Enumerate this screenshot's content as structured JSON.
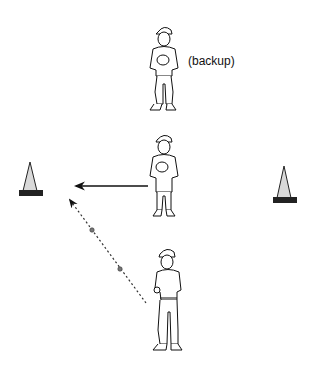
{
  "diagram": {
    "labels": {
      "backup": "(backup)"
    },
    "elements": [
      {
        "id": "cone-left",
        "type": "cone"
      },
      {
        "id": "cone-right",
        "type": "cone"
      },
      {
        "id": "player-backup",
        "type": "player",
        "role": "backup"
      },
      {
        "id": "player-middle",
        "type": "player",
        "role": "fielder"
      },
      {
        "id": "player-coach",
        "type": "player",
        "role": "thrower"
      }
    ],
    "arrows": [
      {
        "from": "player-middle",
        "to": "cone-left",
        "style": "solid"
      },
      {
        "from": "player-coach",
        "to": "cone-left",
        "style": "dotted-with-balls"
      }
    ],
    "colors": {
      "line": "#111111",
      "cone_fill": "#d9d9d9",
      "cone_base": "#222222",
      "ball": "#777777"
    }
  }
}
